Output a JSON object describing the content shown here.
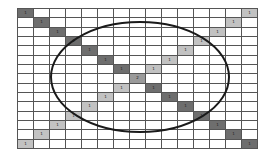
{
  "diagram": {
    "rows": 15,
    "cols": 15,
    "main_diagonal": {
      "label": "1",
      "color": "#6e6e6e"
    },
    "anti_diagonal": {
      "label": "1",
      "color": "#c2c2c2"
    },
    "center": {
      "label": "2",
      "color": "#9a9a9a"
    },
    "ellipse": {
      "cx": 140,
      "cy": 77,
      "rx": 89,
      "ry": 55,
      "stroke": "#1a1a1a",
      "stroke_width": 2
    }
  }
}
